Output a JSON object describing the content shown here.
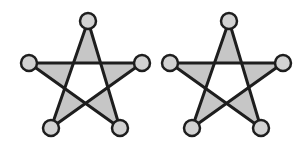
{
  "figure": {
    "width": 308,
    "height": 147,
    "background": "#ffffff",
    "colors": {
      "stroke": "#1e1e1e",
      "tip_fill": "#c6c6c6",
      "node_fill": "#d2d2d2",
      "center_fill": "#ffffff"
    },
    "stroke_width": 3,
    "node_radius": 8,
    "stars": [
      {
        "name": "star-left",
        "nodes": {
          "top": [
            88,
            21
          ],
          "left": [
            29,
            63
          ],
          "right": [
            142,
            63
          ],
          "bottom_left": [
            51,
            128
          ],
          "bottom_right": [
            120,
            128
          ]
        }
      },
      {
        "name": "star-right",
        "nodes": {
          "top": [
            229,
            21
          ],
          "left": [
            170,
            63
          ],
          "right": [
            283,
            63
          ],
          "bottom_left": [
            192,
            128
          ],
          "bottom_right": [
            261,
            128
          ]
        }
      }
    ]
  }
}
